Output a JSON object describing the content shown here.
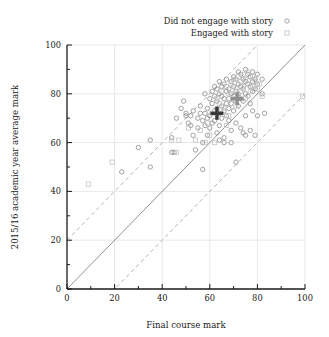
{
  "chart_data": {
    "type": "scatter",
    "title": "",
    "xlabel": "Final course mark",
    "ylabel": "2015/16 academic year average mark",
    "xlim": [
      0,
      100
    ],
    "ylim": [
      0,
      100
    ],
    "xticks": [
      0,
      20,
      40,
      60,
      80,
      100
    ],
    "yticks": [
      0,
      20,
      40,
      60,
      80,
      100
    ],
    "xtick_labels": [
      "0",
      "20",
      "40",
      "60",
      "80",
      "100"
    ],
    "ytick_labels": [
      "0",
      "20",
      "40",
      "60",
      "80",
      "100"
    ],
    "minor_tick_step": 10,
    "grid": true,
    "grid_color": "#d8d8d8",
    "legend_position": "top-right-outside",
    "legend": [
      {
        "label": "Did not engage with story",
        "marker": "circle",
        "color": "#8c8c8c"
      },
      {
        "label": "Engaged with story",
        "marker": "square",
        "color": "#c2c2c2"
      }
    ],
    "reference_lines": [
      {
        "name": "identity",
        "style": "solid",
        "color": "#7d7d7d",
        "intercept": 0,
        "slope": 1
      },
      {
        "name": "upper-band",
        "style": "dashed",
        "color": "#a8a8a8",
        "intercept": 20,
        "slope": 1
      },
      {
        "name": "lower-band",
        "style": "dashed",
        "color": "#a8a8a8",
        "intercept": -20,
        "slope": 1
      }
    ],
    "mean_markers": [
      {
        "name": "mean-not-engaged",
        "marker": "plus",
        "x": 63,
        "y": 72,
        "color": "#3a3a3a"
      },
      {
        "name": "mean-engaged",
        "marker": "plus",
        "x": 71.5,
        "y": 78,
        "color": "#909090"
      }
    ],
    "series": [
      {
        "name": "Did not engage with story",
        "marker": "circle",
        "color": "#8c8c8c",
        "points": [
          [
            23,
            48
          ],
          [
            30,
            58
          ],
          [
            35,
            50
          ],
          [
            35,
            61
          ],
          [
            44,
            56
          ],
          [
            45,
            56
          ],
          [
            44,
            62
          ],
          [
            46,
            70
          ],
          [
            48,
            74
          ],
          [
            49,
            77
          ],
          [
            50,
            71
          ],
          [
            50,
            72
          ],
          [
            51,
            68
          ],
          [
            52,
            71
          ],
          [
            52,
            67
          ],
          [
            53,
            73
          ],
          [
            54,
            57
          ],
          [
            55,
            70
          ],
          [
            55,
            66
          ],
          [
            56,
            72
          ],
          [
            56,
            75
          ],
          [
            57,
            60
          ],
          [
            57,
            69
          ],
          [
            57,
            49
          ],
          [
            58,
            72
          ],
          [
            58,
            67
          ],
          [
            58,
            80
          ],
          [
            59,
            74
          ],
          [
            59,
            70
          ],
          [
            60,
            66
          ],
          [
            60,
            78
          ],
          [
            60,
            71
          ],
          [
            61,
            81
          ],
          [
            61,
            76
          ],
          [
            61,
            68
          ],
          [
            62,
            83
          ],
          [
            62,
            79
          ],
          [
            62,
            73
          ],
          [
            62,
            69
          ],
          [
            63,
            77
          ],
          [
            63,
            82
          ],
          [
            63,
            74
          ],
          [
            63,
            64
          ],
          [
            64,
            80
          ],
          [
            64,
            85
          ],
          [
            64,
            72
          ],
          [
            64,
            67
          ],
          [
            65,
            79
          ],
          [
            65,
            83
          ],
          [
            65,
            75
          ],
          [
            65,
            70
          ],
          [
            66,
            84
          ],
          [
            66,
            78
          ],
          [
            66,
            73
          ],
          [
            66,
            60
          ],
          [
            67,
            81
          ],
          [
            67,
            86
          ],
          [
            67,
            76
          ],
          [
            67,
            71
          ],
          [
            68,
            82
          ],
          [
            68,
            78
          ],
          [
            68,
            74
          ],
          [
            68,
            69
          ],
          [
            69,
            85
          ],
          [
            69,
            80
          ],
          [
            69,
            76
          ],
          [
            69,
            65
          ],
          [
            70,
            87
          ],
          [
            70,
            83
          ],
          [
            70,
            79
          ],
          [
            70,
            73
          ],
          [
            71,
            86
          ],
          [
            71,
            81
          ],
          [
            71,
            77
          ],
          [
            71,
            68
          ],
          [
            72,
            89
          ],
          [
            72,
            84
          ],
          [
            72,
            80
          ],
          [
            72,
            75
          ],
          [
            73,
            88
          ],
          [
            73,
            83
          ],
          [
            73,
            78
          ],
          [
            73,
            66
          ],
          [
            74,
            86
          ],
          [
            74,
            82
          ],
          [
            74,
            77
          ],
          [
            74,
            64
          ],
          [
            75,
            90
          ],
          [
            75,
            85
          ],
          [
            75,
            80
          ],
          [
            75,
            71
          ],
          [
            76,
            88
          ],
          [
            76,
            84
          ],
          [
            76,
            79
          ],
          [
            77,
            87
          ],
          [
            77,
            83
          ],
          [
            77,
            76
          ],
          [
            77,
            65
          ],
          [
            78,
            89
          ],
          [
            78,
            85
          ],
          [
            78,
            81
          ],
          [
            78,
            73
          ],
          [
            79,
            86
          ],
          [
            79,
            82
          ],
          [
            80,
            88
          ],
          [
            80,
            84
          ],
          [
            80,
            71
          ],
          [
            82,
            86
          ],
          [
            82,
            80
          ],
          [
            83,
            72
          ],
          [
            71,
            52
          ],
          [
            69,
            60
          ],
          [
            75,
            63
          ],
          [
            79,
            63
          ],
          [
            64,
            61
          ],
          [
            59,
            63
          ],
          [
            53,
            63
          ],
          [
            66,
            62
          ]
        ]
      },
      {
        "name": "Engaged with story",
        "marker": "square",
        "color": "#c2c2c2",
        "points": [
          [
            9,
            43
          ],
          [
            19,
            52
          ],
          [
            44,
            61
          ],
          [
            47,
            61
          ],
          [
            51,
            66
          ],
          [
            54,
            61
          ],
          [
            56,
            65
          ],
          [
            58,
            60
          ],
          [
            60,
            63
          ],
          [
            62,
            60
          ],
          [
            63,
            78
          ],
          [
            64,
            76
          ],
          [
            65,
            81
          ],
          [
            66,
            74
          ],
          [
            67,
            83
          ],
          [
            68,
            80
          ],
          [
            68,
            71
          ],
          [
            69,
            84
          ],
          [
            70,
            78
          ],
          [
            70,
            86
          ],
          [
            71,
            82
          ],
          [
            71,
            75
          ],
          [
            72,
            87
          ],
          [
            72,
            79
          ],
          [
            73,
            85
          ],
          [
            73,
            81
          ],
          [
            74,
            88
          ],
          [
            74,
            83
          ],
          [
            75,
            86
          ],
          [
            75,
            78
          ],
          [
            76,
            89
          ],
          [
            76,
            84
          ],
          [
            77,
            81
          ],
          [
            78,
            87
          ],
          [
            78,
            83
          ],
          [
            79,
            85
          ],
          [
            80,
            82
          ],
          [
            81,
            84
          ],
          [
            82,
            79
          ],
          [
            99,
            79
          ],
          [
            46,
            56
          ],
          [
            61,
            72
          ],
          [
            59,
            68
          ],
          [
            67,
            67
          ]
        ]
      }
    ]
  }
}
